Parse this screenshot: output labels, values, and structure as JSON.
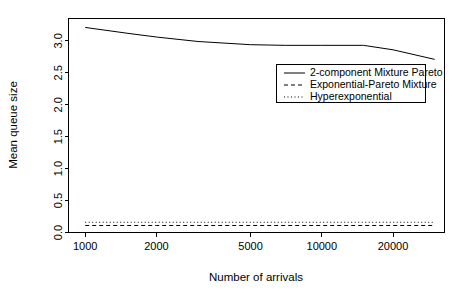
{
  "chart_data": {
    "type": "line",
    "title": "",
    "xlabel": "Number of arrivals",
    "ylabel": "Mean queue size",
    "xscale": "log",
    "xlim": [
      850,
      33000
    ],
    "ylim": [
      0.0,
      3.35
    ],
    "grid": false,
    "legend_position": "center-right",
    "xticks": [
      1000,
      2000,
      5000,
      10000,
      20000
    ],
    "xtick_labels": [
      "1000",
      "2000",
      "5000",
      "10000",
      "20000"
    ],
    "yticks": [
      0.0,
      0.5,
      1.0,
      1.5,
      2.0,
      2.5,
      3.0
    ],
    "ytick_labels": [
      "0.0",
      "0.5",
      "1.0",
      "1.5",
      "2.0",
      "2.5",
      "3.0"
    ],
    "series": [
      {
        "name": "2-component Mixture Pareto",
        "style": "solid",
        "color": "#000000",
        "x": [
          1000,
          1500,
          2000,
          3000,
          5000,
          7000,
          10000,
          15000,
          20000,
          30000
        ],
        "values": [
          3.21,
          3.12,
          3.06,
          2.99,
          2.94,
          2.93,
          2.93,
          2.93,
          2.86,
          2.71
        ]
      },
      {
        "name": "Exponential-Pareto Mixture",
        "style": "dashed",
        "color": "#000000",
        "x": [
          1000,
          1500,
          2000,
          3000,
          5000,
          7000,
          10000,
          15000,
          20000,
          30000
        ],
        "values": [
          0.11,
          0.11,
          0.11,
          0.11,
          0.11,
          0.11,
          0.11,
          0.11,
          0.11,
          0.11
        ]
      },
      {
        "name": "Hyperexponential",
        "style": "dotted",
        "color": "#000000",
        "x": [
          1000,
          1500,
          2000,
          3000,
          5000,
          7000,
          10000,
          15000,
          20000,
          30000
        ],
        "values": [
          0.16,
          0.16,
          0.16,
          0.16,
          0.16,
          0.16,
          0.16,
          0.16,
          0.16,
          0.16
        ]
      }
    ]
  },
  "legend": {
    "entries": [
      {
        "label": "2-component Mixture Pareto",
        "style": "solid"
      },
      {
        "label": "Exponential-Pareto Mixture",
        "style": "dashed"
      },
      {
        "label": "Hyperexponential",
        "style": "dotted"
      }
    ]
  },
  "axes": {
    "x_title": "Number of arrivals",
    "y_title": "Mean queue size",
    "x_tick_labels": [
      "1000",
      "2000",
      "5000",
      "10000",
      "20000"
    ],
    "y_tick_labels": [
      "0.0",
      "0.5",
      "1.0",
      "1.5",
      "2.0",
      "2.5",
      "3.0"
    ]
  }
}
